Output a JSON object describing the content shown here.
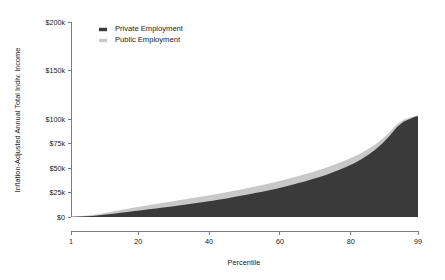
{
  "chart_data": {
    "type": "area",
    "stacked": true,
    "title": "",
    "xlabel": "Percentile",
    "ylabel": "Inflation-Adjusted Annual Total Indiv. Income",
    "xlim": [
      1,
      99
    ],
    "ylim": [
      0,
      200000
    ],
    "grid": false,
    "legend_position": "top-left-inside",
    "x_ticks": [
      1,
      20,
      40,
      60,
      80,
      99
    ],
    "x_tick_labels": [
      "1",
      "20",
      "40",
      "60",
      "80",
      "99"
    ],
    "y_ticks": [
      0,
      25000,
      50000,
      75000,
      100000,
      150000,
      200000
    ],
    "y_tick_labels": [
      "$0",
      "$25k",
      "$50k",
      "$75k",
      "$100k",
      "$150k",
      "$200k"
    ],
    "x": [
      1,
      3,
      5,
      7,
      9,
      11,
      13,
      15,
      17,
      19,
      21,
      23,
      25,
      27,
      29,
      31,
      33,
      35,
      37,
      39,
      41,
      43,
      45,
      47,
      49,
      51,
      53,
      55,
      57,
      59,
      61,
      63,
      65,
      67,
      69,
      71,
      73,
      75,
      77,
      79,
      81,
      83,
      85,
      87,
      89,
      91,
      93,
      95,
      97,
      98,
      99
    ],
    "series": [
      {
        "name": "Private Employment",
        "color": "#3a3a3a",
        "values": [
          200,
          400,
          700,
          1100,
          1700,
          2500,
          3400,
          4300,
          5200,
          6100,
          7000,
          7900,
          8800,
          9700,
          10600,
          11500,
          12500,
          13500,
          14500,
          15600,
          16700,
          17900,
          19100,
          20400,
          21700,
          23100,
          24500,
          26000,
          27500,
          29100,
          30800,
          32600,
          34500,
          36500,
          38600,
          40800,
          43200,
          45800,
          48600,
          51700,
          55200,
          59200,
          63800,
          69200,
          75600,
          83400,
          92000,
          98000,
          101000,
          102500,
          103500
        ]
      },
      {
        "name": "Public Employment",
        "color": "#c8c8c8",
        "values": [
          150,
          350,
          650,
          1000,
          1400,
          1900,
          2400,
          2900,
          3300,
          3700,
          4000,
          4300,
          4600,
          4900,
          5100,
          5300,
          5500,
          5700,
          5900,
          6000,
          6100,
          6200,
          6300,
          6400,
          6500,
          6600,
          6700,
          6800,
          6900,
          7000,
          7100,
          7200,
          7300,
          7400,
          7400,
          7400,
          7400,
          7300,
          7200,
          7000,
          6800,
          6400,
          6000,
          5400,
          4700,
          3800,
          2800,
          1900,
          1200,
          900,
          700
        ]
      }
    ],
    "legend": [
      {
        "label": "Private Employment",
        "color": "#3a3a3a"
      },
      {
        "label": "Public Employment",
        "color": "#c8c8c8"
      }
    ]
  },
  "layout": {
    "plot_left": 71,
    "plot_right": 418,
    "plot_top": 22,
    "plot_bottom": 217
  }
}
